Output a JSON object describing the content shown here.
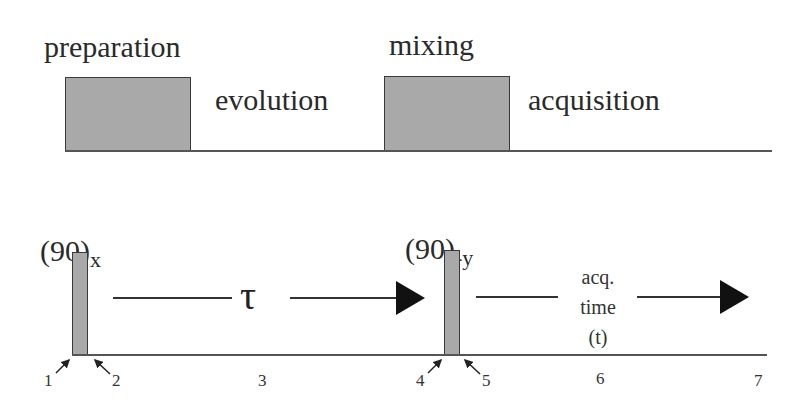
{
  "top_sequence": {
    "labels": {
      "preparation": "preparation",
      "evolution": "evolution",
      "mixing": "mixing",
      "acquisition": "acquisition"
    },
    "box_color": "#a9a9a9"
  },
  "pulse_sequence": {
    "pulse1": {
      "base": "(90)",
      "phase": "x"
    },
    "pulse2": {
      "base": "(90)",
      "phase": "-y"
    },
    "delay_label": "τ",
    "acq_label": {
      "line1": "acq.",
      "line2": "time",
      "line3": "(t)"
    },
    "time_points": [
      "1",
      "2",
      "3",
      "4",
      "5",
      "6",
      "7"
    ],
    "pulse_color": "#a9a9a9"
  }
}
